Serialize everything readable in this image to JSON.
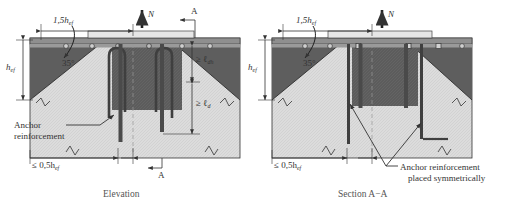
{
  "figure": {
    "type": "engineering-detail-drawing",
    "views": [
      {
        "id": "elevation",
        "caption": "Elevation",
        "labels": {
          "width_dim": "1,5h",
          "width_dim_sub": "ef",
          "depth_dim": "h",
          "depth_dim_sub": "ef",
          "load_arrow": "N",
          "cone_angle": "35°",
          "hook_dev_length": "≥ ℓ",
          "hook_dev_length_sub": "dh",
          "dev_length": "≥ ℓ",
          "dev_length_sub": "d",
          "anchor_note_line1": "Anchor",
          "anchor_note_line2": "reinforcement",
          "edge_dim": "≤ 0,5h",
          "edge_dim_sub": "ef",
          "section_mark_top": "A",
          "section_mark_bottom": "A"
        }
      },
      {
        "id": "section-a-a",
        "caption": "Section A−A",
        "labels": {
          "width_dim": "1,5h",
          "width_dim_sub": "ef",
          "depth_dim": "h",
          "depth_dim_sub": "ef",
          "load_arrow": "N",
          "cone_angle": "35°",
          "edge_dim": "≤ 0,5h",
          "edge_dim_sub": "ef",
          "anchor_note_line1": "Anchor reinforcement",
          "anchor_note_line2": "placed symmetrically"
        }
      }
    ],
    "colors": {
      "concrete_light": "#d8d8d8",
      "concrete_hatch": "#c9c9c9",
      "cone_dark": "#595959",
      "plate_mid": "#8c8c8c",
      "plate_light": "#e8e8e8",
      "rebar": "#4a4a4a",
      "line": "#333333",
      "background": "#ffffff",
      "text": "#333333"
    }
  }
}
